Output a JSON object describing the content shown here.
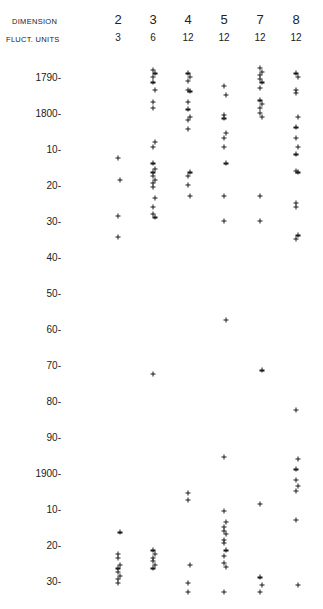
{
  "chart_data": {
    "type": "scatter",
    "title": "",
    "header_rows": [
      {
        "label": "DIMENSION",
        "values": [
          "2",
          "3",
          "4",
          "5",
          "7",
          "8"
        ]
      },
      {
        "label": "FLUCT. UNITS",
        "values": [
          "3",
          "6",
          "12",
          "12",
          "12",
          "12"
        ]
      }
    ],
    "xlabel": "Dimension",
    "ylabel": "Year",
    "y_ticks": [
      "1790-",
      "1800-",
      "10-",
      "20-",
      "30-",
      "40-",
      "50-",
      "60-",
      "70-",
      "80-",
      "90-",
      "1900-",
      "10-",
      "20-",
      "30-"
    ],
    "y_tick_years": [
      1790,
      1800,
      1810,
      1820,
      1830,
      1840,
      1850,
      1860,
      1870,
      1880,
      1890,
      1900,
      1910,
      1920,
      1930
    ],
    "ylim": [
      1786,
      1934
    ],
    "y_inverted": true,
    "grid": false,
    "legend": null,
    "columns_x_px": [
      118,
      153,
      188,
      224,
      260,
      296
    ],
    "series": [
      {
        "name": "Dimension 2 (3 units)",
        "x": 118,
        "years": [
          1812.5,
          1818.5,
          1828.5,
          1834.5,
          1916.5,
          1922.5,
          1923.5,
          1925.5,
          1926.5,
          1927.5,
          1928.5,
          1929.5,
          1930.5
        ]
      },
      {
        "name": "Dimension 3 (6 units)",
        "x": 153,
        "years": [
          1788,
          1789,
          1790,
          1791.5,
          1793.5,
          1797,
          1798.5,
          1808,
          1809.5,
          1814,
          1815.5,
          1816.5,
          1817.5,
          1818.5,
          1819.5,
          1820.5,
          1823.5,
          1826,
          1828,
          1829,
          1872.5,
          1921.5,
          1922.5,
          1923.5,
          1924.5,
          1925.5,
          1926.5
        ]
      },
      {
        "name": "Dimension 4 (12 units)",
        "x": 188,
        "years": [
          1789,
          1790,
          1791,
          1793.5,
          1794,
          1797,
          1799,
          1801,
          1802,
          1804.5,
          1816.5,
          1817.5,
          1820,
          1823,
          1905.5,
          1907.5,
          1925.5,
          1930.5,
          1933
        ]
      },
      {
        "name": "Dimension 5 (12 units)",
        "x": 224,
        "years": [
          1792.5,
          1795,
          1800.5,
          1801.5,
          1805.5,
          1807,
          1809.5,
          1814,
          1823,
          1830,
          1857.5,
          1895.5,
          1910.5,
          1913.5,
          1915,
          1916,
          1917,
          1918.5,
          1919.5,
          1921.5,
          1923,
          1925,
          1926,
          1933
        ]
      },
      {
        "name": "Dimension 7 (12 units)",
        "x": 260,
        "years": [
          1787.5,
          1788.5,
          1789.5,
          1790.5,
          1791.5,
          1793,
          1796.5,
          1797.5,
          1798.5,
          1800,
          1801,
          1823,
          1830,
          1871.5,
          1908.5,
          1929,
          1931,
          1933
        ]
      },
      {
        "name": "Dimension 8 (12 units)",
        "x": 296,
        "years": [
          1789,
          1790,
          1793.5,
          1794.5,
          1801,
          1804,
          1807,
          1809.5,
          1811.5,
          1816,
          1816.5,
          1825,
          1826,
          1834,
          1835,
          1882.5,
          1896,
          1899,
          1902,
          1903.5,
          1905,
          1913,
          1931
        ]
      }
    ]
  }
}
